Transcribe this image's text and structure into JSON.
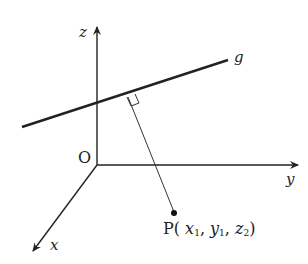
{
  "diagram": {
    "type": "3d-coordinate-axes",
    "axes": {
      "z_label": "z",
      "y_label": "y",
      "x_label": "x",
      "origin_label": "O"
    },
    "line_label": "g",
    "point": {
      "name": "P",
      "open": "(",
      "x": "x",
      "x_sub": "1",
      "sep1": ",",
      "y": "y",
      "y_sub": "1",
      "sep2": ",",
      "z": "z",
      "z_sub": "2",
      "close": ")"
    },
    "annotations": [
      "right-angle marker at foot of perpendicular from P to g"
    ],
    "colors": {
      "ink": "#222222",
      "background": "#ffffff"
    }
  }
}
